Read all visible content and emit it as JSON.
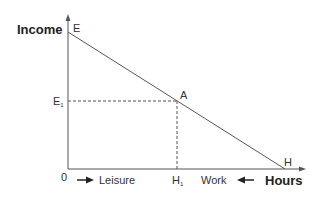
{
  "diagram": {
    "y_axis_label": "Income",
    "x_axis_label": "Hours",
    "origin_label": "0",
    "points": {
      "E": {
        "label": "E"
      },
      "A": {
        "label": "A"
      },
      "H": {
        "label": "H"
      },
      "E1": {
        "label": "E",
        "sub": "1"
      },
      "H1": {
        "label": "H",
        "sub": "1"
      }
    },
    "arrows": {
      "leisure": {
        "label": "Leisure",
        "direction": "right"
      },
      "work": {
        "label": "Work",
        "direction": "left"
      }
    },
    "colors": {
      "axis": "#555555",
      "line": "#555555",
      "text": "#333333",
      "background": "#ffffff"
    }
  }
}
